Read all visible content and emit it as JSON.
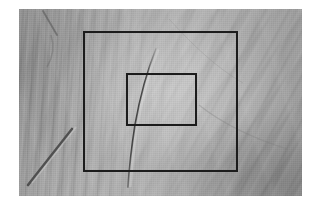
{
  "canvas": {
    "width": 321,
    "height": 205,
    "background_color": "#ffffff"
  },
  "photo": {
    "subject": "creased gray fabric sheet",
    "kind": "grayscale-photograph",
    "x": 19,
    "y": 9,
    "width": 283,
    "height": 187,
    "tone_light": "#b8b8b8",
    "tone_mid": "#a8a8a8",
    "tone_dark": "#9a9a9a"
  },
  "features": {
    "center_crack": {
      "name": "dark curved crack line",
      "color": "#4a4a4a",
      "points": "137,46 124,77 117,110 113,150 111,172"
    },
    "lower_left_streak": {
      "name": "thin diagonal dark streak",
      "color": "#5a5a5a",
      "x1": 51,
      "y1": 126,
      "x2": 9,
      "y2": 179
    },
    "upper_left_streak": {
      "name": "short diagonal dark streak",
      "color": "#6a6a6a",
      "x1": 41,
      "y1": 11,
      "x2": 53,
      "y2": 30
    }
  },
  "annotations": {
    "stroke_color": "#1c1c1c",
    "stroke_width": 2,
    "boxes": [
      {
        "id": "outer-box",
        "label": "outer annotation rectangle",
        "x": 64,
        "y": 22,
        "width": 155,
        "height": 141
      },
      {
        "id": "inner-box",
        "label": "inner annotation rectangle",
        "x": 107,
        "y": 64,
        "width": 71,
        "height": 53
      }
    ]
  }
}
